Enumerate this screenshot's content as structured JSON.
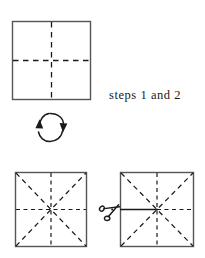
{
  "figure": {
    "type": "paper-folding-instruction-diagram",
    "background_color": "#ffffff",
    "ink_color": "#1a1a1a",
    "outline_color": "#4a4a4a",
    "caption": "steps 1 and 2",
    "panels": [
      {
        "id": "top-square",
        "name": "square-with-cross-creases",
        "x": 12,
        "y": 21,
        "width": 79,
        "height": 79,
        "crease_lines": [
          "vertical-center",
          "horizontal-center"
        ],
        "line_style": "dashed"
      },
      {
        "id": "bottom-left-square",
        "name": "square-with-star-creases",
        "x": 15,
        "y": 172,
        "width": 72,
        "height": 75,
        "crease_lines": [
          "vertical-center",
          "horizontal-center",
          "diagonal-tl-br",
          "diagonal-bl-tr"
        ],
        "line_style": "dashed"
      },
      {
        "id": "bottom-right-square",
        "name": "square-with-star-creases-and-cut",
        "x": 120,
        "y": 172,
        "width": 74,
        "height": 75,
        "crease_lines": [
          "vertical-center",
          "horizontal-center",
          "diagonal-tl-br",
          "diagonal-bl-tr"
        ],
        "line_style": "dashed",
        "cut_line": {
          "name": "scissors-cut-line",
          "from_x": 120,
          "from_y": 209,
          "to_x": 157,
          "to_y": 209,
          "style": "solid"
        }
      }
    ],
    "flip_arrow": {
      "name": "flip-over-rotation-arrow",
      "center_x": 51,
      "center_y": 127,
      "radius_x": 11,
      "radius_y": 14,
      "arrowheads": [
        "down-right",
        "up-left"
      ]
    },
    "scissors": {
      "name": "scissors-icon",
      "x": 113,
      "y": 208,
      "glyph": "scissors"
    }
  }
}
